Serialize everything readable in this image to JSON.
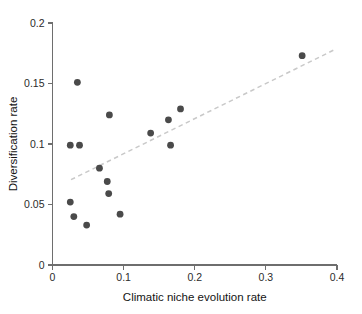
{
  "chart_data": {
    "type": "scatter",
    "title": "",
    "xlabel": "Climatic niche evolution rate",
    "ylabel": "Diversification rate",
    "xlim": [
      0,
      0.4
    ],
    "ylim": [
      0,
      0.2
    ],
    "xticks": [
      0,
      0.1,
      0.2,
      0.3,
      0.4
    ],
    "xtick_labels": [
      "0",
      "0.1",
      "0.2",
      "0.3",
      "0.4"
    ],
    "yticks": [
      0,
      0.05,
      0.1,
      0.15,
      0.2
    ],
    "ytick_labels": [
      "0",
      "0.05",
      "0.1",
      "0.15",
      "0.2"
    ],
    "grid": false,
    "legend": null,
    "point_color": "#4a4a4a",
    "point_radius": 3.4,
    "trendline": {
      "style": "dashed",
      "color": "#c9c9c9",
      "x": [
        0.026,
        0.395
      ],
      "y": [
        0.0705,
        0.1775
      ]
    },
    "x": [
      0.025,
      0.03,
      0.025,
      0.038,
      0.035,
      0.048,
      0.066,
      0.077,
      0.079,
      0.08,
      0.095,
      0.138,
      0.163,
      0.166,
      0.18,
      0.351
    ],
    "y": [
      0.052,
      0.04,
      0.099,
      0.099,
      0.151,
      0.033,
      0.08,
      0.069,
      0.059,
      0.124,
      0.042,
      0.109,
      0.12,
      0.099,
      0.129,
      0.173
    ],
    "points": [
      {
        "x": 0.025,
        "y": 0.052
      },
      {
        "x": 0.03,
        "y": 0.04
      },
      {
        "x": 0.025,
        "y": 0.099
      },
      {
        "x": 0.038,
        "y": 0.099
      },
      {
        "x": 0.035,
        "y": 0.151
      },
      {
        "x": 0.048,
        "y": 0.033
      },
      {
        "x": 0.066,
        "y": 0.08
      },
      {
        "x": 0.077,
        "y": 0.069
      },
      {
        "x": 0.079,
        "y": 0.059
      },
      {
        "x": 0.08,
        "y": 0.124
      },
      {
        "x": 0.095,
        "y": 0.042
      },
      {
        "x": 0.138,
        "y": 0.109
      },
      {
        "x": 0.163,
        "y": 0.12
      },
      {
        "x": 0.166,
        "y": 0.099
      },
      {
        "x": 0.18,
        "y": 0.129
      },
      {
        "x": 0.351,
        "y": 0.173
      }
    ]
  },
  "axes": {
    "x_title": "Climatic niche evolution rate",
    "y_title": "Diversification rate"
  }
}
